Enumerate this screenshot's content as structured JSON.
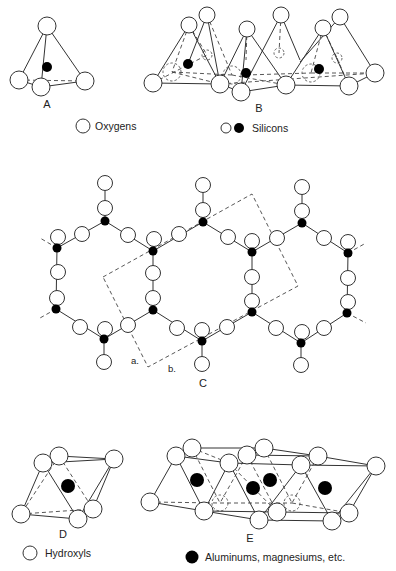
{
  "figure": {
    "panels": {
      "A": {
        "label": "A",
        "label_pos": [
          47,
          108
        ],
        "oxygens": [
          [
            47,
            26,
            9
          ],
          [
            19,
            80,
            9
          ],
          [
            41,
            87,
            9
          ],
          [
            85,
            81,
            9
          ]
        ],
        "silicons": [
          [
            47,
            67,
            5
          ]
        ],
        "edges": [
          [
            47,
            26,
            19,
            80
          ],
          [
            47,
            26,
            41,
            87
          ],
          [
            47,
            26,
            85,
            81
          ],
          [
            19,
            80,
            41,
            87
          ],
          [
            41,
            87,
            85,
            81
          ]
        ],
        "dashed": [
          [
            19,
            80,
            85,
            81
          ]
        ],
        "legend": {
          "symbol": "open-circle",
          "text": "Oxygens",
          "circle": [
            83,
            126
          ],
          "text_pos": [
            95,
            130
          ]
        }
      },
      "B": {
        "label": "B",
        "label_pos": [
          259,
          112
        ],
        "oxygens": [
          [
            189,
            25,
            8
          ],
          [
            207,
            15,
            8
          ],
          [
            247,
            29,
            8
          ],
          [
            281,
            15,
            8
          ],
          [
            323,
            28,
            8
          ],
          [
            340,
            17,
            8
          ],
          [
            153,
            83,
            9
          ],
          [
            220,
            84,
            9
          ],
          [
            241,
            92,
            9
          ],
          [
            286,
            85,
            9
          ],
          [
            349,
            86,
            9
          ],
          [
            375,
            73,
            9
          ]
        ],
        "hidden_oxygens": [
          [
            207,
            55,
            5
          ],
          [
            279,
            53,
            5
          ],
          [
            337,
            58,
            5
          ],
          [
            172,
            72,
            9
          ],
          [
            232,
            75,
            9
          ],
          [
            311,
            73,
            9
          ]
        ],
        "silicons": [
          [
            188,
            64,
            5
          ],
          [
            246,
            73,
            5
          ],
          [
            319,
            69,
            5
          ]
        ],
        "edges": [
          [
            189,
            25,
            153,
            83
          ],
          [
            189,
            25,
            220,
            84
          ],
          [
            153,
            83,
            220,
            84
          ],
          [
            207,
            15,
            220,
            84
          ],
          [
            207,
            15,
            188,
            64
          ],
          [
            247,
            29,
            220,
            84
          ],
          [
            247,
            29,
            241,
            92
          ],
          [
            247,
            29,
            286,
            85
          ],
          [
            241,
            92,
            286,
            85
          ],
          [
            281,
            15,
            241,
            92
          ],
          [
            281,
            15,
            300,
            60
          ],
          [
            323,
            28,
            286,
            85
          ],
          [
            323,
            28,
            349,
            86
          ],
          [
            286,
            85,
            349,
            86
          ],
          [
            340,
            17,
            375,
            73
          ],
          [
            340,
            17,
            300,
            62
          ],
          [
            349,
            86,
            375,
            73
          ],
          [
            220,
            84,
            241,
            92
          ]
        ],
        "dashed": [
          [
            189,
            25,
            172,
            72
          ],
          [
            189,
            25,
            207,
            55
          ],
          [
            172,
            72,
            232,
            75
          ],
          [
            153,
            83,
            207,
            55
          ],
          [
            207,
            15,
            232,
            75
          ],
          [
            247,
            29,
            246,
            60
          ],
          [
            246,
            75,
            311,
            73
          ],
          [
            281,
            15,
            279,
            53
          ],
          [
            323,
            28,
            311,
            73
          ],
          [
            323,
            28,
            337,
            58
          ],
          [
            311,
            73,
            375,
            73
          ],
          [
            337,
            58,
            349,
            86
          ],
          [
            172,
            72,
            220,
            84
          ],
          [
            232,
            75,
            286,
            85
          ],
          [
            220,
            84,
            375,
            73
          ]
        ],
        "legend": {
          "symbol_open": [
            226,
            128
          ],
          "symbol_filled": [
            239,
            128
          ],
          "text": "Silicons",
          "text_pos": [
            252,
            132
          ]
        }
      },
      "C": {
        "label": "C",
        "label_pos": [
          203,
          387
        ],
        "sublabels": [
          {
            "text": "a.",
            "pos": [
              131,
              364
            ]
          },
          {
            "text": "b.",
            "pos": [
              168,
              372
            ]
          }
        ],
        "unit_cell": [
          [
            103,
            277
          ],
          [
            252,
            194
          ],
          [
            298,
            286
          ],
          [
            148,
            367
          ]
        ],
        "silicons": [
          [
            105,
            221
          ],
          [
            57,
            248
          ],
          [
            56,
            309
          ],
          [
            104,
            339
          ],
          [
            153,
            251
          ],
          [
            153,
            310
          ],
          [
            203,
            222
          ],
          [
            202,
            341
          ],
          [
            252,
            252
          ],
          [
            252,
            312
          ],
          [
            302,
            223
          ],
          [
            301,
            343
          ],
          [
            348,
            253
          ],
          [
            347,
            313
          ]
        ],
        "oxygens": [
          [
            105,
            183
          ],
          [
            105,
            208
          ],
          [
            82,
            234
          ],
          [
            58,
            237
          ],
          [
            58,
            272
          ],
          [
            57,
            298
          ],
          [
            80,
            327
          ],
          [
            105,
            329
          ],
          [
            104,
            362
          ],
          [
            128,
            235
          ],
          [
            154,
            239
          ],
          [
            179,
            234
          ],
          [
            153,
            273
          ],
          [
            153,
            298
          ],
          [
            128,
            325
          ],
          [
            177,
            328
          ],
          [
            203,
            185
          ],
          [
            203,
            210
          ],
          [
            202,
            330
          ],
          [
            202,
            364
          ],
          [
            228,
            237
          ],
          [
            252,
            241
          ],
          [
            277,
            238
          ],
          [
            252,
            277
          ],
          [
            252,
            301
          ],
          [
            227,
            327
          ],
          [
            276,
            328
          ],
          [
            302,
            187
          ],
          [
            302,
            211
          ],
          [
            324,
            238
          ],
          [
            348,
            242
          ],
          [
            348,
            278
          ],
          [
            348,
            302
          ],
          [
            324,
            328
          ],
          [
            302,
            332
          ],
          [
            301,
            365
          ]
        ],
        "bonds": [
          [
            105,
            183,
            105,
            221
          ],
          [
            105,
            221,
            57,
            248
          ],
          [
            105,
            221,
            153,
            251
          ],
          [
            57,
            248,
            56,
            309
          ],
          [
            56,
            309,
            104,
            339
          ],
          [
            104,
            339,
            153,
            310
          ],
          [
            104,
            339,
            104,
            362
          ],
          [
            153,
            251,
            153,
            310
          ],
          [
            153,
            251,
            203,
            222
          ],
          [
            153,
            310,
            202,
            341
          ],
          [
            203,
            185,
            203,
            222
          ],
          [
            203,
            222,
            252,
            252
          ],
          [
            202,
            341,
            252,
            312
          ],
          [
            202,
            341,
            202,
            364
          ],
          [
            252,
            252,
            252,
            312
          ],
          [
            252,
            252,
            302,
            223
          ],
          [
            252,
            312,
            301,
            343
          ],
          [
            302,
            187,
            302,
            223
          ],
          [
            302,
            223,
            348,
            253
          ],
          [
            348,
            253,
            347,
            313
          ],
          [
            347,
            313,
            301,
            343
          ],
          [
            301,
            343,
            301,
            365
          ]
        ],
        "stubs": [
          [
            57,
            248,
            40,
            238
          ],
          [
            56,
            309,
            40,
            318
          ],
          [
            348,
            253,
            366,
            243
          ],
          [
            347,
            313,
            366,
            323
          ]
        ]
      },
      "D": {
        "label": "D",
        "label_pos": [
          63,
          538
        ],
        "oxygens": [
          [
            59,
            456,
            9
          ],
          [
            43,
            463,
            9
          ],
          [
            114,
            459,
            9
          ],
          [
            21,
            514,
            9
          ],
          [
            78,
            519,
            9
          ],
          [
            93,
            509,
            9
          ]
        ],
        "cations": [
          [
            68,
            486,
            7
          ]
        ],
        "edges": [
          [
            43,
            463,
            21,
            514
          ],
          [
            43,
            463,
            78,
            519
          ],
          [
            59,
            456,
            114,
            459
          ],
          [
            43,
            463,
            114,
            459
          ],
          [
            21,
            514,
            78,
            519
          ],
          [
            114,
            459,
            78,
            519
          ],
          [
            114,
            459,
            93,
            509
          ],
          [
            78,
            519,
            93,
            509
          ],
          [
            59,
            456,
            43,
            463
          ]
        ],
        "dashed": [
          [
            59,
            456,
            21,
            514
          ],
          [
            59,
            456,
            93,
            509
          ],
          [
            21,
            514,
            93,
            509
          ]
        ],
        "legend": {
          "symbol": "open-circle",
          "text": "Hydroxyls",
          "circle": [
            30,
            553
          ],
          "text_pos": [
            45,
            557
          ]
        }
      },
      "E": {
        "label": "E",
        "label_pos": [
          250,
          542
        ],
        "oxygens": [
          [
            150,
            502,
            9
          ],
          [
            176,
            456,
            9
          ],
          [
            192,
            448,
            9
          ],
          [
            204,
            511,
            9
          ],
          [
            229,
            463,
            9
          ],
          [
            247,
            455,
            9
          ],
          [
            264,
            448,
            9
          ],
          [
            259,
            520,
            9
          ],
          [
            277,
            512,
            9
          ],
          [
            301,
            465,
            9
          ],
          [
            318,
            456,
            9
          ],
          [
            376,
            466,
            9
          ],
          [
            332,
            521,
            9
          ],
          [
            349,
            513,
            9
          ]
        ],
        "hidden_oxygens": [
          [
            220,
            503,
            8
          ],
          [
            292,
            503,
            8
          ]
        ],
        "cations": [
          [
            197,
            480,
            7
          ],
          [
            253,
            488,
            7
          ],
          [
            270,
            480,
            7
          ],
          [
            325,
            488,
            7
          ]
        ],
        "edges": [
          [
            176,
            456,
            150,
            502
          ],
          [
            176,
            456,
            204,
            511
          ],
          [
            150,
            502,
            204,
            511
          ],
          [
            192,
            448,
            264,
            448
          ],
          [
            176,
            456,
            229,
            463
          ],
          [
            229,
            463,
            204,
            511
          ],
          [
            229,
            463,
            259,
            520
          ],
          [
            204,
            511,
            259,
            520
          ],
          [
            247,
            455,
            318,
            456
          ],
          [
            264,
            448,
            318,
            456
          ],
          [
            301,
            465,
            259,
            520
          ],
          [
            301,
            465,
            332,
            521
          ],
          [
            259,
            520,
            332,
            521
          ],
          [
            318,
            456,
            376,
            466
          ],
          [
            376,
            466,
            332,
            521
          ],
          [
            376,
            466,
            349,
            513
          ],
          [
            301,
            465,
            376,
            466
          ],
          [
            229,
            463,
            301,
            465
          ],
          [
            176,
            456,
            192,
            448
          ],
          [
            332,
            521,
            349,
            513
          ],
          [
            204,
            511,
            277,
            512
          ],
          [
            277,
            512,
            349,
            513
          ]
        ],
        "dashed": [
          [
            192,
            448,
            220,
            503
          ],
          [
            150,
            502,
            220,
            503
          ],
          [
            220,
            503,
            292,
            503
          ],
          [
            247,
            455,
            220,
            503
          ],
          [
            264,
            448,
            292,
            503
          ],
          [
            292,
            503,
            349,
            513
          ],
          [
            318,
            456,
            292,
            503
          ],
          [
            192,
            448,
            229,
            463
          ],
          [
            247,
            455,
            277,
            512
          ],
          [
            229,
            463,
            277,
            512
          ]
        ],
        "legend": {
          "symbol": "filled-circle",
          "text": "Aluminums, magnesiums, etc.",
          "circle": [
            192,
            557
          ],
          "text_pos": [
            205,
            561
          ]
        }
      }
    }
  }
}
